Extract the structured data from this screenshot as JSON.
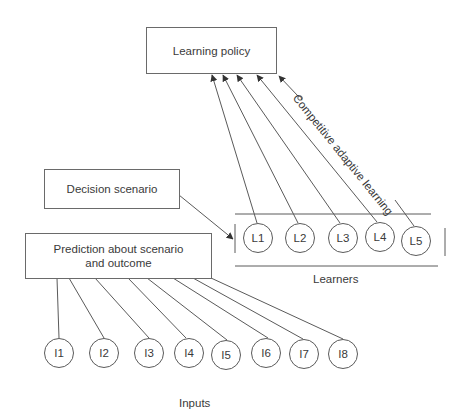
{
  "diagram": {
    "boxes": {
      "learning_policy": "Learning policy",
      "decision_scenario": "Decision scenario",
      "prediction": "Prediction about scenario and outcome"
    },
    "edge_label": "Competitive adaptive learning",
    "groups": {
      "learners_label": "Learners",
      "inputs_label": "Inputs"
    },
    "learners": [
      "L1",
      "L2",
      "L3",
      "L4",
      "L5"
    ],
    "inputs": [
      "I1",
      "I2",
      "I3",
      "I4",
      "I5",
      "I6",
      "I7",
      "I8"
    ],
    "colors": {
      "stroke": "#5a5a5a",
      "text": "#3a3a3a",
      "background": "#ffffff"
    }
  }
}
